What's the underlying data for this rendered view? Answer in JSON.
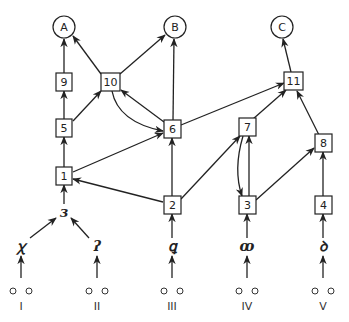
{
  "diagram": {
    "title": "",
    "outputs": [
      {
        "id": "A",
        "label": "A",
        "x": 64,
        "y": 27
      },
      {
        "id": "B",
        "label": "B",
        "x": 175,
        "y": 27
      },
      {
        "id": "C",
        "label": "C",
        "x": 282,
        "y": 27
      }
    ],
    "boxes": [
      {
        "id": "9",
        "label": "9",
        "x": 64,
        "y": 82
      },
      {
        "id": "10",
        "label": "10",
        "x": 110,
        "y": 82
      },
      {
        "id": "11",
        "label": "11",
        "x": 293,
        "y": 81
      },
      {
        "id": "5",
        "label": "5",
        "x": 64,
        "y": 128
      },
      {
        "id": "6",
        "label": "6",
        "x": 172,
        "y": 129
      },
      {
        "id": "7",
        "label": "7",
        "x": 247,
        "y": 127
      },
      {
        "id": "8",
        "label": "8",
        "x": 323,
        "y": 143
      },
      {
        "id": "1",
        "label": "1",
        "x": 64,
        "y": 176
      },
      {
        "id": "2",
        "label": "2",
        "x": 172,
        "y": 205
      },
      {
        "id": "3",
        "label": "3",
        "x": 247,
        "y": 205
      },
      {
        "id": "4",
        "label": "4",
        "x": 323,
        "y": 205
      }
    ],
    "glyphs": [
      {
        "id": "g-mid",
        "label": "ɜ",
        "x": 64,
        "y": 213
      },
      {
        "id": "g-I",
        "label": "ꭓ",
        "x": 21,
        "y": 247
      },
      {
        "id": "g-II",
        "label": "ʔ",
        "x": 97,
        "y": 247
      },
      {
        "id": "g-III",
        "label": "ꝗ",
        "x": 172,
        "y": 247
      },
      {
        "id": "g-IV",
        "label": "ꝏ",
        "x": 247,
        "y": 247
      },
      {
        "id": "g-V",
        "label": "ꝺ",
        "x": 323,
        "y": 247
      }
    ],
    "inputs": [
      {
        "id": "I",
        "label": "I",
        "x": 21
      },
      {
        "id": "II",
        "label": "II",
        "x": 97
      },
      {
        "id": "III",
        "label": "III",
        "x": 172
      },
      {
        "id": "IV",
        "label": "IV",
        "x": 247
      },
      {
        "id": "V",
        "label": "V",
        "x": 323
      }
    ],
    "edges": [
      {
        "from": "9",
        "to": "A"
      },
      {
        "from": "10",
        "to": "A"
      },
      {
        "from": "10",
        "to": "B"
      },
      {
        "from": "6",
        "to": "B"
      },
      {
        "from": "11",
        "to": "C"
      },
      {
        "from": "5",
        "to": "9"
      },
      {
        "from": "5",
        "to": "10"
      },
      {
        "from": "6",
        "to": "10"
      },
      {
        "from": "10",
        "to": "6",
        "curved": true
      },
      {
        "from": "6",
        "to": "11"
      },
      {
        "from": "7",
        "to": "11"
      },
      {
        "from": "8",
        "to": "11"
      },
      {
        "from": "1",
        "to": "5"
      },
      {
        "from": "1",
        "to": "6"
      },
      {
        "from": "2",
        "to": "6"
      },
      {
        "from": "2",
        "to": "1"
      },
      {
        "from": "2",
        "to": "7"
      },
      {
        "from": "3",
        "to": "7"
      },
      {
        "from": "7",
        "to": "3",
        "curved": true
      },
      {
        "from": "3",
        "to": "8"
      },
      {
        "from": "4",
        "to": "8"
      }
    ]
  }
}
